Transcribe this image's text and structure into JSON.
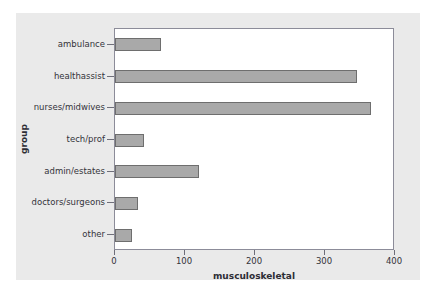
{
  "chart_data": {
    "type": "bar",
    "orientation": "horizontal",
    "title": "",
    "xlabel": "musculoskeletal",
    "ylabel": "group",
    "categories": [
      "ambulance",
      "healthassist",
      "nurses/midwives",
      "tech/prof",
      "admin/estates",
      "doctors/surgeons",
      "other"
    ],
    "values": [
      65,
      345,
      366,
      42,
      120,
      33,
      24
    ],
    "xlim": [
      0,
      400
    ],
    "xticks": [
      0,
      100,
      200,
      300,
      400
    ],
    "xtick_labels": [
      "0",
      "100",
      "200",
      "300",
      "400"
    ],
    "grid": false,
    "legend": null,
    "bar_color": "#a9a9a9",
    "bar_edge_color": "#6e6e6e",
    "figure_background": "#eaeaea",
    "plot_background": "#ffffff",
    "axis_color": "#8c8c99"
  }
}
